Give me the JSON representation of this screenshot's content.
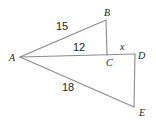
{
  "figure": {
    "type": "geometry-diagram",
    "stroke_color": "#8a8a8a",
    "label_color": "#1a1a1a",
    "background_color": "#ffffff",
    "width": 156,
    "height": 125,
    "vertices": [
      {
        "name": "A",
        "label": "A",
        "x": 20,
        "y": 57
      },
      {
        "name": "B",
        "label": "B",
        "x": 106,
        "y": 20
      },
      {
        "name": "C",
        "label": "C",
        "x": 107,
        "y": 55
      },
      {
        "name": "D",
        "label": "D",
        "x": 134,
        "y": 54
      },
      {
        "name": "E",
        "label": "E",
        "x": 134,
        "y": 107
      }
    ],
    "segments": [
      {
        "name": "AB",
        "from": "A",
        "to": "B"
      },
      {
        "name": "BC",
        "from": "B",
        "to": "C"
      },
      {
        "name": "AD",
        "from": "A",
        "to": "D"
      },
      {
        "name": "AE",
        "from": "A",
        "to": "E"
      },
      {
        "name": "DE",
        "from": "D",
        "to": "E"
      }
    ],
    "measures": [
      {
        "name": "AB",
        "label": "15"
      },
      {
        "name": "AC",
        "label": "12"
      },
      {
        "name": "AE",
        "label": "18"
      },
      {
        "name": "CD",
        "label": "x"
      }
    ]
  }
}
